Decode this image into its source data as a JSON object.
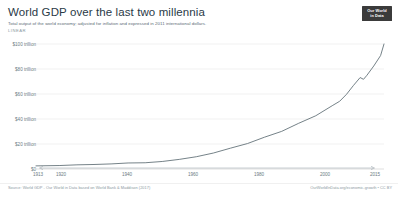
{
  "header": {
    "title": "World GDP over the last two millennia",
    "subtitle": "Total output of the world economy; adjusted for inflation and expressed in 2011 international dollars.",
    "scale_label": "LINEAR"
  },
  "logo": {
    "line1": "Our World",
    "line2": "in Data"
  },
  "footer": {
    "source": "Source: World GDP - Our World in Data based on World Bank & Maddison (2017)",
    "credit": "OurWorldInData.org/economic-growth • CC BY"
  },
  "colors": {
    "line": "#5c6b73",
    "grid": "#e8e8e8",
    "text": "#6b7a83",
    "title": "#2a3a47",
    "logo_bg": "#3b3b3b"
  },
  "chart_data": {
    "type": "line",
    "title": "World GDP over the last two millennia",
    "subtitle": "Total output of the world economy; adjusted for inflation and expressed in 2011 international dollars.",
    "xlabel": "",
    "ylabel": "",
    "scale": "LINEAR",
    "grid": true,
    "legend": "none",
    "xlim": [
      1913,
      2015
    ],
    "ylim": [
      0,
      108
    ],
    "yunit": "trillion 2011 international dollars",
    "ytick_values": [
      0,
      20,
      40,
      60,
      80,
      100
    ],
    "ytick_labels": [
      "$0",
      "$20 trillion",
      "$40 trillion",
      "$60 trillion",
      "$80 trillion",
      "$100 trillion"
    ],
    "xtick_values": [
      1913,
      1920,
      1940,
      1960,
      1980,
      2000,
      2015
    ],
    "xtick_labels": [
      "1913",
      "1920",
      "1940",
      "1960",
      "1980",
      "2000",
      "2015"
    ],
    "series": [
      {
        "name": "World GDP",
        "x": [
          1913,
          1920,
          1925,
          1930,
          1935,
          1940,
          1945,
          1950,
          1955,
          1960,
          1965,
          1970,
          1975,
          1980,
          1985,
          1990,
          1995,
          2000,
          2002,
          2004,
          2006,
          2008,
          2009,
          2010,
          2012,
          2014,
          2015
        ],
        "values": [
          2.7,
          3.0,
          3.6,
          3.9,
          4.4,
          5.2,
          5.4,
          6.5,
          8.3,
          10.6,
          13.8,
          18.0,
          22.0,
          27.5,
          32.5,
          39.5,
          46.0,
          55.0,
          58.5,
          64.5,
          72.0,
          79.0,
          77.5,
          81.0,
          89.0,
          98.0,
          108.0
        ]
      }
    ],
    "annotations": [
      {
        "label": "global financial crisis dip",
        "x": 2009,
        "y": 77.5
      }
    ]
  }
}
